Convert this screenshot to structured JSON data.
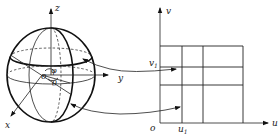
{
  "sphere": {
    "axes": {
      "x_label": "x",
      "y_label": "y",
      "z_label": "z"
    },
    "origin_label": "o",
    "angle_labels": {
      "phi": "φ",
      "theta": "θ"
    }
  },
  "plane": {
    "axes": {
      "u_label": "u",
      "v_label": "v"
    },
    "origin_label": "o",
    "u1_label": "u",
    "u1_sub": "1",
    "v1_label": "v",
    "v1_sub": "1",
    "grid": {
      "vertical_lines_x": [
        160,
        182,
        203,
        243
      ],
      "horizontal_lines_y": [
        46,
        67,
        85,
        123
      ]
    }
  },
  "mappings": [
    {
      "from": "sphere-latitude-band",
      "to": "grid-row-v1",
      "double_headed": true
    },
    {
      "from": "sphere-longitude-band",
      "to": "grid-column-u1",
      "double_headed": true
    }
  ]
}
